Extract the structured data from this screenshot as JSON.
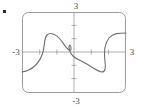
{
  "figure": {
    "bullet_marker": "▪",
    "frame": {
      "x": 22,
      "y": 12,
      "width": 104,
      "height": 81,
      "corner_radius": 6,
      "stroke_color": "#9a9a9a"
    },
    "axes": {
      "origin_x": 74,
      "origin_y": 52,
      "stroke_color": "#9a9a9a",
      "x_tick_spacing_px": 17.3,
      "y_tick_spacing_px": 13.3,
      "x_tick_count_each_side": 3,
      "y_tick_count_each_side": 3
    },
    "labels": {
      "top": "3",
      "bottom": "-3",
      "left": "-3",
      "right": "3",
      "text_color": "#4a4a4a"
    },
    "curve": {
      "stroke_color": "#6e6e6e",
      "path": "M 22,72 C 34,70 40,62 43,52 C 45,44 44,38 47,35 C 50,32 56,34 60,39 C 64,44 66,48 69,50 C 71,51 71,50 71,48 C 71,45 69,44 69,47 C 69,51 71,54 73,56 C 76,59 80,60 85,63 C 92,67 98,72 102,72 C 105,72 106,68 105,62 C 104,54 104,44 109,38 C 113,33 119,33 126,33"
    }
  },
  "chart_data": {
    "type": "line",
    "title": "",
    "xlabel": "",
    "ylabel": "",
    "xlim": [
      -3,
      3
    ],
    "ylim": [
      -3,
      3
    ],
    "xticks": [
      -3,
      -2,
      -1,
      0,
      1,
      2,
      3
    ],
    "yticks": [
      -3,
      -2,
      -1,
      0,
      1,
      2,
      3
    ],
    "xtick_labels": [
      "-3",
      "",
      "",
      "",
      "",
      "",
      "3"
    ],
    "ytick_labels": [
      "-3",
      "",
      "",
      "",
      "",
      "",
      "3"
    ],
    "grid": false,
    "legend": null,
    "series": [
      {
        "name": "relation",
        "description": "sideways S-shaped relation; fails the vertical line test",
        "x": [
          -3.0,
          -2.4,
          -2.0,
          -1.7,
          -1.5,
          -1.2,
          -0.9,
          -0.6,
          -0.3,
          -0.15,
          -0.1,
          -0.1,
          0.0,
          0.2,
          0.5,
          1.0,
          1.6,
          2.0,
          2.2,
          2.3,
          2.2,
          2.1,
          2.2,
          2.6,
          3.0
        ],
        "y": [
          -0.75,
          -0.65,
          -0.35,
          0.0,
          0.3,
          0.6,
          0.75,
          0.65,
          0.45,
          0.25,
          0.1,
          -0.05,
          -0.15,
          -0.3,
          -0.45,
          -0.6,
          -0.75,
          -0.75,
          -0.7,
          -0.45,
          -0.1,
          0.3,
          0.6,
          0.8,
          0.85
        ]
      }
    ]
  }
}
